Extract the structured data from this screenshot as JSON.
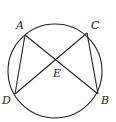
{
  "diagram": {
    "type": "circle-chords",
    "circle": {
      "cx": 55,
      "cy": 71,
      "r": 47
    },
    "points": {
      "A": {
        "x": 25,
        "y": 35,
        "label": "A",
        "lx": 16,
        "ly": 29
      },
      "C": {
        "x": 87,
        "y": 33,
        "label": "C",
        "lx": 91,
        "ly": 29
      },
      "D": {
        "x": 15,
        "y": 94,
        "label": "D",
        "lx": 2,
        "ly": 104
      },
      "B": {
        "x": 98,
        "y": 94,
        "label": "B",
        "lx": 101,
        "ly": 104
      },
      "E": {
        "x": 56,
        "y": 60,
        "label": "E",
        "lx": 53,
        "ly": 77
      }
    },
    "segments": [
      [
        "A",
        "B"
      ],
      [
        "C",
        "D"
      ],
      [
        "A",
        "D"
      ],
      [
        "C",
        "B"
      ]
    ],
    "stroke_color": "#222222"
  }
}
